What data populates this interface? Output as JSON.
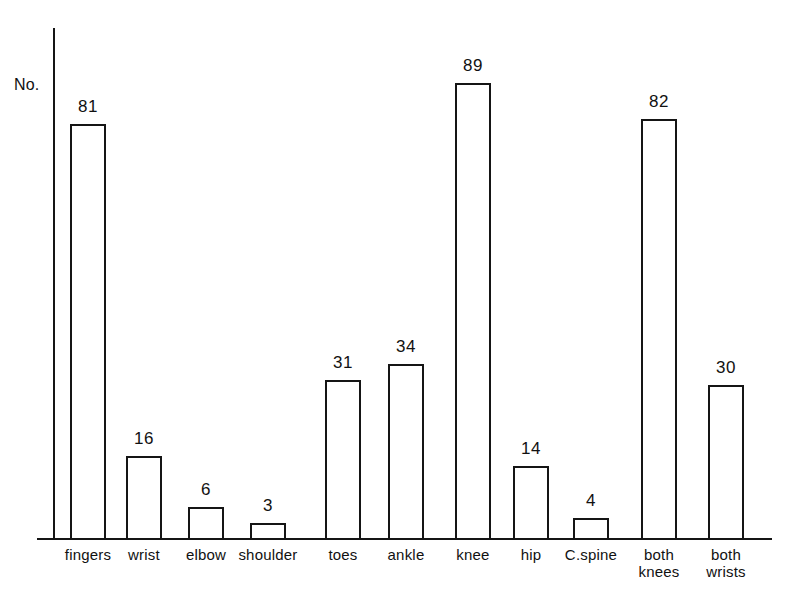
{
  "chart_data": {
    "type": "bar",
    "title": "",
    "subtitle": "",
    "xlabel": "",
    "ylabel": "No.",
    "ylim": [
      0,
      95
    ],
    "grid": false,
    "legend": null,
    "orientation": "vertical",
    "bar_style": "outline",
    "categories": [
      "fingers",
      "wrist",
      "elbow",
      "shoulder",
      "toes",
      "ankle",
      "knee",
      "hip",
      "C.spine",
      "both\nknees",
      "both\nwrists"
    ],
    "values": [
      81,
      16,
      6,
      3,
      31,
      34,
      89,
      14,
      4,
      82,
      30
    ],
    "value_labels": [
      "81",
      "16",
      "6",
      "3",
      "31",
      "34",
      "89",
      "14",
      "4",
      "82",
      "30"
    ],
    "xtick_labels": [
      "fingers",
      "wrist",
      "elbow",
      "shoulder",
      "toes",
      "ankle",
      "knee",
      "hip",
      "C.spine",
      "both\nknees",
      "both\nwrists"
    ],
    "ytick_labels": [],
    "colors": {
      "background": "#ffffff",
      "axis": "#151515",
      "bar_edge": "#151515",
      "bar_fill": "#ffffff",
      "text": "#111111"
    }
  },
  "axes": {
    "y_label": "No."
  }
}
